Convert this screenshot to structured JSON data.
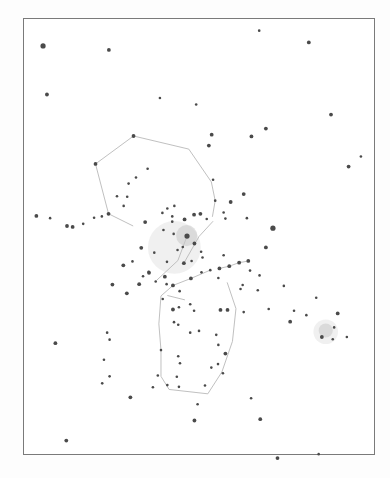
{
  "figure": {
    "kind": "hand-drawn star chart",
    "ink_color": "#4a4a4a",
    "line_color": "#b9b9b9",
    "paper_color": "#ffffff",
    "frame_color": "#7a7a7a"
  },
  "sky": {
    "units": "normalized chart coordinates (0-100 across, 0-100 down)",
    "stars": [
      {
        "x": 5.7,
        "y": 6.4,
        "mag": 3
      },
      {
        "x": 24.4,
        "y": 7.3,
        "mag": 2
      },
      {
        "x": 67.1,
        "y": 2.9,
        "mag": 1
      },
      {
        "x": 81.2,
        "y": 5.6,
        "mag": 2
      },
      {
        "x": 6.8,
        "y": 17.5,
        "mag": 2
      },
      {
        "x": 38.9,
        "y": 18.3,
        "mag": 1
      },
      {
        "x": 49.2,
        "y": 19.8,
        "mag": 1
      },
      {
        "x": 96.0,
        "y": 31.7,
        "mag": 1
      },
      {
        "x": 92.5,
        "y": 34.0,
        "mag": 2
      },
      {
        "x": 87.5,
        "y": 22.1,
        "mag": 2
      },
      {
        "x": 69.0,
        "y": 25.3,
        "mag": 2
      },
      {
        "x": 64.9,
        "y": 27.1,
        "mag": 2
      },
      {
        "x": 53.6,
        "y": 26.7,
        "mag": 2
      },
      {
        "x": 52.8,
        "y": 29.2,
        "mag": 2
      },
      {
        "x": 31.4,
        "y": 27.0,
        "mag": 2
      },
      {
        "x": 20.6,
        "y": 33.4,
        "mag": 2
      },
      {
        "x": 35.4,
        "y": 34.5,
        "mag": 1
      },
      {
        "x": 32.1,
        "y": 36.5,
        "mag": 1
      },
      {
        "x": 30.0,
        "y": 37.9,
        "mag": 1
      },
      {
        "x": 26.7,
        "y": 40.8,
        "mag": 1
      },
      {
        "x": 29.6,
        "y": 40.9,
        "mag": 1
      },
      {
        "x": 54.0,
        "y": 37.0,
        "mag": 1
      },
      {
        "x": 54.6,
        "y": 41.8,
        "mag": 1
      },
      {
        "x": 24.3,
        "y": 44.8,
        "mag": 2
      },
      {
        "x": 3.8,
        "y": 45.3,
        "mag": 2
      },
      {
        "x": 7.7,
        "y": 45.8,
        "mag": 1
      },
      {
        "x": 12.5,
        "y": 47.6,
        "mag": 2
      },
      {
        "x": 14.1,
        "y": 47.8,
        "mag": 2
      },
      {
        "x": 17.1,
        "y": 47.1,
        "mag": 1
      },
      {
        "x": 20.2,
        "y": 45.7,
        "mag": 1
      },
      {
        "x": 22.4,
        "y": 45.4,
        "mag": 1
      },
      {
        "x": 28.6,
        "y": 43.0,
        "mag": 1
      },
      {
        "x": 34.7,
        "y": 46.7,
        "mag": 2
      },
      {
        "x": 39.6,
        "y": 44.6,
        "mag": 1
      },
      {
        "x": 41.0,
        "y": 43.6,
        "mag": 1
      },
      {
        "x": 43.0,
        "y": 43.0,
        "mag": 1
      },
      {
        "x": 42.4,
        "y": 45.4,
        "mag": 1
      },
      {
        "x": 42.4,
        "y": 46.6,
        "mag": 1
      },
      {
        "x": 45.9,
        "y": 46.1,
        "mag": 2
      },
      {
        "x": 48.6,
        "y": 45.0,
        "mag": 2
      },
      {
        "x": 50.4,
        "y": 44.8,
        "mag": 2
      },
      {
        "x": 52.2,
        "y": 46.0,
        "mag": 1
      },
      {
        "x": 59.0,
        "y": 42.1,
        "mag": 2
      },
      {
        "x": 62.7,
        "y": 40.3,
        "mag": 2
      },
      {
        "x": 57.5,
        "y": 45.9,
        "mag": 1
      },
      {
        "x": 57.0,
        "y": 44.5,
        "mag": 1
      },
      {
        "x": 63.6,
        "y": 45.8,
        "mag": 1
      },
      {
        "x": 42.8,
        "y": 49.4,
        "mag": 1
      },
      {
        "x": 46.6,
        "y": 49.9,
        "mag": 3
      },
      {
        "x": 39.9,
        "y": 48.5,
        "mag": 1
      },
      {
        "x": 43.9,
        "y": 53.1,
        "mag": 1
      },
      {
        "x": 45.4,
        "y": 52.4,
        "mag": 1
      },
      {
        "x": 48.7,
        "y": 51.6,
        "mag": 2
      },
      {
        "x": 50.6,
        "y": 53.5,
        "mag": 1
      },
      {
        "x": 51.0,
        "y": 54.8,
        "mag": 1
      },
      {
        "x": 47.9,
        "y": 55.6,
        "mag": 1
      },
      {
        "x": 45.7,
        "y": 56.1,
        "mag": 2
      },
      {
        "x": 40.9,
        "y": 55.8,
        "mag": 1
      },
      {
        "x": 37.3,
        "y": 53.7,
        "mag": 1
      },
      {
        "x": 33.6,
        "y": 52.6,
        "mag": 2
      },
      {
        "x": 31.1,
        "y": 55.7,
        "mag": 1
      },
      {
        "x": 28.5,
        "y": 56.6,
        "mag": 2
      },
      {
        "x": 35.7,
        "y": 58.1,
        "mag": 1
      },
      {
        "x": 34.1,
        "y": 59.1,
        "mag": 1
      },
      {
        "x": 37.7,
        "y": 60.3,
        "mag": 1
      },
      {
        "x": 40.3,
        "y": 59.2,
        "mag": 2
      },
      {
        "x": 42.6,
        "y": 61.2,
        "mag": 2
      },
      {
        "x": 47.7,
        "y": 59.6,
        "mag": 2
      },
      {
        "x": 50.7,
        "y": 58.2,
        "mag": 1
      },
      {
        "x": 53.2,
        "y": 57.7,
        "mag": 1
      },
      {
        "x": 55.8,
        "y": 57.3,
        "mag": 2
      },
      {
        "x": 58.6,
        "y": 56.8,
        "mag": 2
      },
      {
        "x": 61.4,
        "y": 56.0,
        "mag": 2
      },
      {
        "x": 64.0,
        "y": 55.6,
        "mag": 2
      },
      {
        "x": 69.0,
        "y": 52.5,
        "mag": 2
      },
      {
        "x": 71.0,
        "y": 48.1,
        "mag": 3
      },
      {
        "x": 57.0,
        "y": 54.3,
        "mag": 1
      },
      {
        "x": 55.5,
        "y": 59.5,
        "mag": 1
      },
      {
        "x": 61.8,
        "y": 62.0,
        "mag": 1
      },
      {
        "x": 66.7,
        "y": 62.3,
        "mag": 1
      },
      {
        "x": 64.5,
        "y": 57.8,
        "mag": 1
      },
      {
        "x": 67.2,
        "y": 58.9,
        "mag": 1
      },
      {
        "x": 35.8,
        "y": 58.3,
        "mag": 2
      },
      {
        "x": 33.0,
        "y": 60.9,
        "mag": 2
      },
      {
        "x": 40.8,
        "y": 60.9,
        "mag": 1
      },
      {
        "x": 44.5,
        "y": 62.5,
        "mag": 1
      },
      {
        "x": 25.4,
        "y": 61.0,
        "mag": 2
      },
      {
        "x": 29.5,
        "y": 63.0,
        "mag": 2
      },
      {
        "x": 39.7,
        "y": 64.3,
        "mag": 1
      },
      {
        "x": 42.6,
        "y": 66.7,
        "mag": 2
      },
      {
        "x": 44.3,
        "y": 66.2,
        "mag": 1
      },
      {
        "x": 47.5,
        "y": 65.5,
        "mag": 1
      },
      {
        "x": 48.6,
        "y": 67.0,
        "mag": 1
      },
      {
        "x": 42.9,
        "y": 69.6,
        "mag": 1
      },
      {
        "x": 44.1,
        "y": 70.2,
        "mag": 1
      },
      {
        "x": 47.5,
        "y": 72.0,
        "mag": 1
      },
      {
        "x": 50.0,
        "y": 71.6,
        "mag": 1
      },
      {
        "x": 56.1,
        "y": 66.8,
        "mag": 2
      },
      {
        "x": 58.1,
        "y": 66.8,
        "mag": 2
      },
      {
        "x": 62.7,
        "y": 67.3,
        "mag": 1
      },
      {
        "x": 54.9,
        "y": 72.5,
        "mag": 1
      },
      {
        "x": 55.5,
        "y": 74.8,
        "mag": 1
      },
      {
        "x": 57.5,
        "y": 76.8,
        "mag": 2
      },
      {
        "x": 56.8,
        "y": 81.3,
        "mag": 1
      },
      {
        "x": 53.5,
        "y": 80.0,
        "mag": 1
      },
      {
        "x": 51.7,
        "y": 84.1,
        "mag": 1
      },
      {
        "x": 44.1,
        "y": 77.4,
        "mag": 1
      },
      {
        "x": 44.6,
        "y": 79.0,
        "mag": 1
      },
      {
        "x": 43.7,
        "y": 82.1,
        "mag": 1
      },
      {
        "x": 44.3,
        "y": 84.4,
        "mag": 1
      },
      {
        "x": 39.2,
        "y": 76.0,
        "mag": 1
      },
      {
        "x": 38.3,
        "y": 81.8,
        "mag": 1
      },
      {
        "x": 41.0,
        "y": 84.0,
        "mag": 1
      },
      {
        "x": 23.9,
        "y": 72.0,
        "mag": 1
      },
      {
        "x": 24.6,
        "y": 73.6,
        "mag": 1
      },
      {
        "x": 23.0,
        "y": 78.2,
        "mag": 1
      },
      {
        "x": 24.6,
        "y": 82.0,
        "mag": 1
      },
      {
        "x": 22.5,
        "y": 83.6,
        "mag": 1
      },
      {
        "x": 9.2,
        "y": 74.4,
        "mag": 2
      },
      {
        "x": 36.9,
        "y": 84.5,
        "mag": 1
      },
      {
        "x": 62.4,
        "y": 61.1,
        "mag": 1
      },
      {
        "x": 74.1,
        "y": 61.3,
        "mag": 1
      },
      {
        "x": 69.8,
        "y": 66.6,
        "mag": 1
      },
      {
        "x": 75.9,
        "y": 69.5,
        "mag": 2
      },
      {
        "x": 77.0,
        "y": 67.0,
        "mag": 1
      },
      {
        "x": 83.3,
        "y": 64.0,
        "mag": 1
      },
      {
        "x": 80.5,
        "y": 68.0,
        "mag": 1
      },
      {
        "x": 89.4,
        "y": 67.6,
        "mag": 2
      },
      {
        "x": 88.4,
        "y": 70.8,
        "mag": 1
      },
      {
        "x": 92.0,
        "y": 73.0,
        "mag": 1
      },
      {
        "x": 88.0,
        "y": 73.5,
        "mag": 1
      },
      {
        "x": 84.9,
        "y": 73.0,
        "mag": 2
      },
      {
        "x": 55.4,
        "y": 79.2,
        "mag": 1
      },
      {
        "x": 49.6,
        "y": 88.4,
        "mag": 1
      },
      {
        "x": 30.5,
        "y": 86.8,
        "mag": 2
      },
      {
        "x": 64.8,
        "y": 87.0,
        "mag": 1
      },
      {
        "x": 67.4,
        "y": 91.8,
        "mag": 2
      },
      {
        "x": 48.7,
        "y": 92.1,
        "mag": 2
      },
      {
        "x": 12.3,
        "y": 96.7,
        "mag": 2
      },
      {
        "x": 72.3,
        "y": 100.7,
        "mag": 2
      },
      {
        "x": 84.0,
        "y": 99.8,
        "mag": 1
      }
    ],
    "lines": [
      [
        [
          31.4,
          27.0
        ],
        [
          47.1,
          30.0
        ]
      ],
      [
        [
          47.1,
          30.0
        ],
        [
          53.5,
          37.5
        ]
      ],
      [
        [
          53.5,
          37.5
        ],
        [
          54.6,
          41.8
        ]
      ],
      [
        [
          54.6,
          41.8
        ],
        [
          53.8,
          45.5
        ]
      ],
      [
        [
          31.4,
          27.0
        ],
        [
          20.6,
          33.4
        ]
      ],
      [
        [
          20.6,
          33.4
        ],
        [
          24.3,
          44.8
        ]
      ],
      [
        [
          24.3,
          44.8
        ],
        [
          31.3,
          47.6
        ]
      ],
      [
        [
          46.6,
          49.9
        ],
        [
          44.0,
          55.5
        ]
      ],
      [
        [
          44.0,
          55.5
        ],
        [
          38.0,
          60.0
        ]
      ],
      [
        [
          55.8,
          57.3
        ],
        [
          58.6,
          56.8
        ]
      ],
      [
        [
          61.4,
          56.0
        ],
        [
          64.0,
          55.6
        ]
      ],
      [
        [
          53.2,
          57.7
        ],
        [
          47.7,
          59.6
        ]
      ],
      [
        [
          47.7,
          59.6
        ],
        [
          42.6,
          61.2
        ]
      ],
      [
        [
          42.6,
          61.2
        ],
        [
          39.2,
          63.6
        ]
      ],
      [
        [
          39.2,
          63.6
        ],
        [
          38.6,
          70.0
        ]
      ],
      [
        [
          38.6,
          70.0
        ],
        [
          39.2,
          76.0
        ]
      ],
      [
        [
          39.2,
          76.0
        ],
        [
          39.2,
          82.0
        ]
      ],
      [
        [
          39.2,
          82.0
        ],
        [
          41.5,
          85.0
        ]
      ],
      [
        [
          41.5,
          85.0
        ],
        [
          52.5,
          86.0
        ]
      ],
      [
        [
          52.5,
          86.0
        ],
        [
          56.5,
          81.0
        ]
      ],
      [
        [
          56.5,
          81.0
        ],
        [
          59.5,
          74.0
        ]
      ],
      [
        [
          59.5,
          74.0
        ],
        [
          60.5,
          66.5
        ]
      ],
      [
        [
          60.5,
          66.5
        ],
        [
          58.0,
          60.5
        ]
      ],
      [
        [
          41.0,
          63.5
        ],
        [
          46.0,
          64.5
        ]
      ],
      [
        [
          58.6,
          56.8
        ],
        [
          62.0,
          55.8
        ]
      ],
      [
        [
          45.7,
          56.1
        ],
        [
          50.0,
          50.0
        ]
      ],
      [
        [
          50.0,
          50.0
        ],
        [
          54.0,
          46.5
        ]
      ]
    ],
    "nebulae": [
      {
        "x": 46.5,
        "y": 49.8,
        "r": 3.0
      },
      {
        "x": 86.0,
        "y": 71.5,
        "r": 2.0
      }
    ],
    "haze": [
      {
        "x": 43.0,
        "y": 52.5,
        "r": 7.5
      },
      {
        "x": 86.0,
        "y": 71.8,
        "r": 3.5
      }
    ]
  }
}
